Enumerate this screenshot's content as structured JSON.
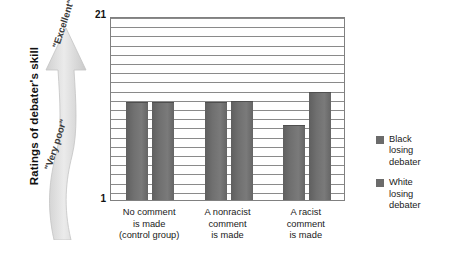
{
  "chart_data": {
    "type": "bar",
    "title": "",
    "xlabel": "",
    "ylabel": "Ratings of debater's skill",
    "ylim": [
      1,
      21
    ],
    "y_ticks": [
      "1",
      "21"
    ],
    "y_axis_low_label": "\"Very poor\"",
    "y_axis_high_label": "\"Excellent\"",
    "grid": true,
    "gridline_count": 20,
    "legend_position": "right",
    "categories": [
      "No comment is made (control group)",
      "A nonracist comment is made",
      "A racist comment is made"
    ],
    "category_lines": [
      [
        "No comment",
        "is made",
        "(control group)"
      ],
      [
        "A nonracist",
        "comment",
        "is made"
      ],
      [
        "A racist",
        "comment",
        "is made"
      ]
    ],
    "series": [
      {
        "name": "Black losing debater",
        "values": [
          11.5,
          11.5,
          9.0
        ]
      },
      {
        "name": "White losing debater",
        "values": [
          11.5,
          11.6,
          12.6
        ]
      }
    ],
    "bar_color": "#6b6b6b",
    "gridline_color": "#8a8a8a",
    "axis_color": "#808080"
  },
  "axis": {
    "max_label": "21",
    "min_label": "1"
  },
  "y_title": "Ratings of debater's skill",
  "arrow": {
    "top_label": "\"Excellent\"",
    "bottom_label": "\"Very poor\""
  },
  "legend": {
    "items": [
      {
        "lines": [
          "Black",
          "losing",
          "debater"
        ],
        "color": "#6b6b6b"
      },
      {
        "lines": [
          "White",
          "losing",
          "debater"
        ],
        "color": "#6b6b6b"
      }
    ]
  }
}
